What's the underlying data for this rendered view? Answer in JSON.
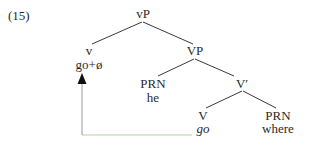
{
  "example_number": "(15)",
  "tree": {
    "root": {
      "label": "vP"
    },
    "v": {
      "label": "v",
      "word": "go+ø"
    },
    "vp": {
      "label": "VP"
    },
    "subject": {
      "label": "PRN",
      "word": "he"
    },
    "vbar": {
      "label": "V′"
    },
    "verb": {
      "label": "V",
      "word": "go"
    },
    "object": {
      "label": "PRN",
      "word": "where"
    }
  },
  "movement_arrow": {
    "from": "V go",
    "to": "v go+ø",
    "line_color": "#a9c4a0",
    "arrow_color": "#1a1a1a"
  }
}
